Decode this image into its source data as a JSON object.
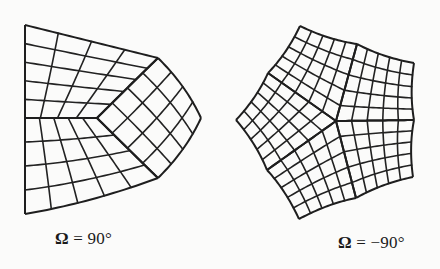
{
  "figures": [
    {
      "id": "left",
      "caption": {
        "symbol": "Ω",
        "equals": " = ",
        "value": "90°"
      },
      "stroke_color": "#222222",
      "blocks": [
        {
          "name": "upper-block",
          "corners": [
            [
              25,
              25
            ],
            [
              25,
              118
            ],
            [
              97,
              118
            ],
            [
              158,
              58
            ]
          ],
          "bulge_top": [
            0,
            0,
            -6,
            0
          ],
          "nu": 5,
          "nv": 4
        },
        {
          "name": "lower-block",
          "corners": [
            [
              25,
              118
            ],
            [
              25,
              214
            ],
            [
              158,
              178
            ],
            [
              97,
              118
            ]
          ],
          "nu": 4,
          "nv": 5
        },
        {
          "name": "right-block",
          "corners": [
            [
              97,
              118
            ],
            [
              158,
              178
            ],
            [
              201,
              118
            ],
            [
              158,
              58
            ]
          ],
          "nu": 4,
          "nv": 4
        }
      ]
    },
    {
      "id": "right",
      "caption": {
        "symbol": "Ω",
        "equals": " = ",
        "value": "−90°"
      },
      "stroke_color": "#222222",
      "blocks": [
        {
          "name": "top-left-block",
          "corners": [
            [
              336,
              121
            ],
            [
              268,
              73
            ],
            [
              300,
              26
            ],
            [
              357,
              44
            ]
          ],
          "nu": 5,
          "nv": 5
        },
        {
          "name": "top-right-block",
          "corners": [
            [
              336,
              121
            ],
            [
              357,
              44
            ],
            [
              414,
              63
            ],
            [
              414,
              120
            ]
          ],
          "nu": 5,
          "nv": 5
        },
        {
          "name": "bottom-right-block",
          "corners": [
            [
              336,
              121
            ],
            [
              414,
              120
            ],
            [
              413,
              177
            ],
            [
              356,
              198
            ]
          ],
          "nu": 5,
          "nv": 5
        },
        {
          "name": "bottom-left-block",
          "corners": [
            [
              336,
              121
            ],
            [
              356,
              198
            ],
            [
              299,
              219
            ],
            [
              267,
              170
            ]
          ],
          "nu": 5,
          "nv": 5
        },
        {
          "name": "left-block",
          "corners": [
            [
              336,
              121
            ],
            [
              267,
              170
            ],
            [
              236,
              120
            ],
            [
              268,
              73
            ]
          ],
          "nu": 5,
          "nv": 5
        }
      ]
    }
  ]
}
